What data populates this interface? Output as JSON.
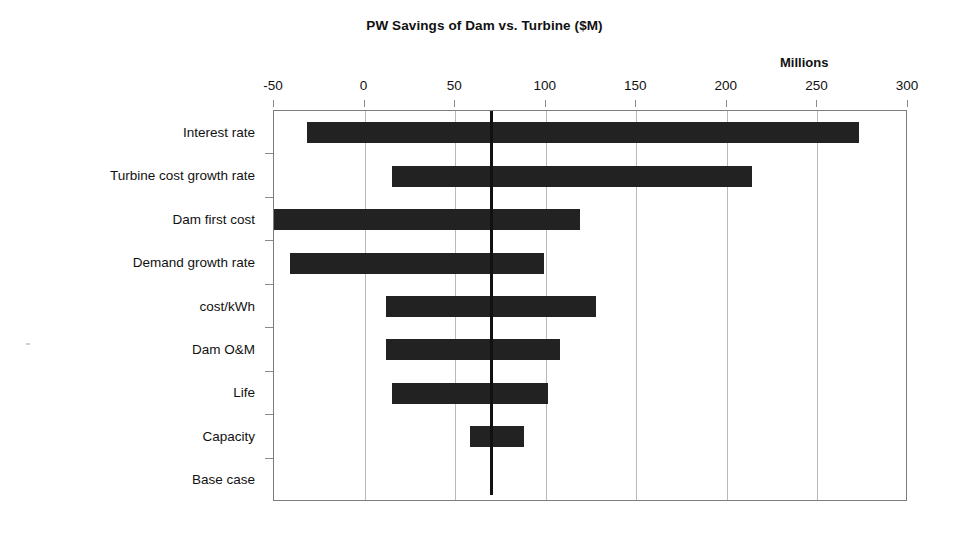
{
  "chart_data": {
    "type": "bar",
    "subtype": "tornado",
    "title": "PW Savings of Dam vs. Turbine  ($M)",
    "units_label": "Millions",
    "xlabel": "",
    "ylabel": "",
    "xlim": [
      -50,
      300
    ],
    "xticks": [
      -50,
      0,
      50,
      100,
      150,
      200,
      250,
      300
    ],
    "xticklabels": [
      "-50",
      "0",
      "50",
      "100",
      "150",
      "200",
      "250",
      "300"
    ],
    "grid": true,
    "legend": false,
    "base_case_value": 70,
    "bar_color": "#222222",
    "gridline_color": "#b9b9b9",
    "axis_color": "#7d7d7d",
    "base_case_line_color": "#111111",
    "categories": [
      "Interest rate",
      "Turbine cost growth rate",
      "Dam first cost",
      "Demand growth rate",
      "cost/kWh",
      "Dam O&M",
      "Life",
      "Capacity",
      "Base case"
    ],
    "bars": [
      {
        "category": "Interest rate",
        "low": -32,
        "high": 273
      },
      {
        "category": "Turbine cost growth rate",
        "low": 15,
        "high": 214
      },
      {
        "category": "Dam first cost",
        "low": -50,
        "high": 119
      },
      {
        "category": "Demand growth rate",
        "low": -41,
        "high": 99
      },
      {
        "category": "cost/kWh",
        "low": 12,
        "high": 128
      },
      {
        "category": "Dam O&M",
        "low": 12,
        "high": 108
      },
      {
        "category": "Life",
        "low": 15,
        "high": 101
      },
      {
        "category": "Capacity",
        "low": 58,
        "high": 88
      },
      {
        "category": "Base case",
        "low": null,
        "high": null
      }
    ]
  }
}
